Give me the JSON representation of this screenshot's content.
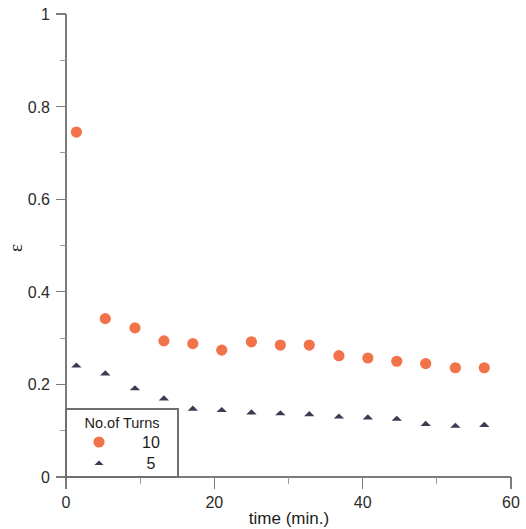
{
  "chart_data": {
    "type": "scatter",
    "title": "",
    "xlabel": "time (min.)",
    "ylabel": "ε",
    "xlim": [
      0,
      60
    ],
    "ylim": [
      0,
      1
    ],
    "grid": false,
    "x_ticks_major": [
      0,
      20,
      40,
      60
    ],
    "x_tick_labels": [
      "0",
      "20",
      "40",
      "60"
    ],
    "x_ticks_minor": [
      10,
      30,
      50
    ],
    "y_ticks_major": [
      0,
      0.2,
      0.4,
      0.6,
      0.8,
      1
    ],
    "y_tick_labels": [
      "0",
      "0.2",
      "0.4",
      "0.6",
      "0.8",
      "1"
    ],
    "y_ticks_minor": [
      0.1,
      0.3,
      0.5,
      0.7,
      0.9
    ],
    "legend": {
      "title": "No.of Turns",
      "position": "bottom-left",
      "entries": [
        {
          "label": "10",
          "marker": "circle",
          "color": "#f2734a"
        },
        {
          "label": "5",
          "marker": "triangle",
          "color": "#3a3c52"
        }
      ]
    },
    "series": [
      {
        "name": "10",
        "marker": "circle",
        "color": "#f2734a",
        "points": [
          {
            "x": 1.4,
            "y": 0.745
          },
          {
            "x": 5.3,
            "y": 0.342
          },
          {
            "x": 9.3,
            "y": 0.322
          },
          {
            "x": 13.2,
            "y": 0.294
          },
          {
            "x": 17.1,
            "y": 0.288
          },
          {
            "x": 21.0,
            "y": 0.274
          },
          {
            "x": 25.0,
            "y": 0.292
          },
          {
            "x": 28.9,
            "y": 0.285
          },
          {
            "x": 32.8,
            "y": 0.285
          },
          {
            "x": 36.8,
            "y": 0.262
          },
          {
            "x": 40.7,
            "y": 0.257
          },
          {
            "x": 44.6,
            "y": 0.25
          },
          {
            "x": 48.5,
            "y": 0.245
          },
          {
            "x": 52.5,
            "y": 0.236
          },
          {
            "x": 56.4,
            "y": 0.236
          }
        ]
      },
      {
        "name": "5",
        "marker": "triangle",
        "color": "#3a3c52",
        "points": [
          {
            "x": 1.4,
            "y": 0.241
          },
          {
            "x": 5.3,
            "y": 0.224
          },
          {
            "x": 9.3,
            "y": 0.192
          },
          {
            "x": 13.2,
            "y": 0.17
          },
          {
            "x": 17.1,
            "y": 0.148
          },
          {
            "x": 21.0,
            "y": 0.145
          },
          {
            "x": 25.0,
            "y": 0.14
          },
          {
            "x": 28.9,
            "y": 0.138
          },
          {
            "x": 32.8,
            "y": 0.136
          },
          {
            "x": 36.8,
            "y": 0.131
          },
          {
            "x": 40.7,
            "y": 0.129
          },
          {
            "x": 44.6,
            "y": 0.126
          },
          {
            "x": 48.5,
            "y": 0.115
          },
          {
            "x": 52.5,
            "y": 0.111
          },
          {
            "x": 56.4,
            "y": 0.113
          }
        ]
      }
    ]
  }
}
